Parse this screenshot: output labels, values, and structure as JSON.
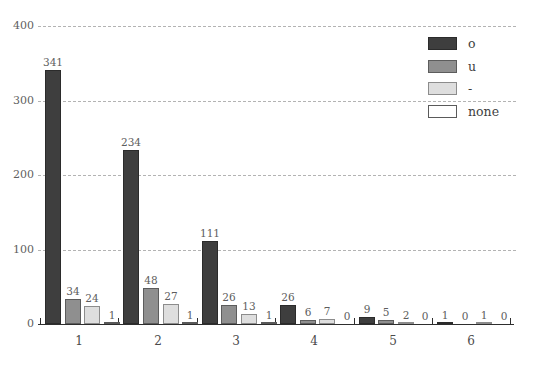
{
  "chart_data": {
    "type": "bar",
    "title": "",
    "xlabel": "",
    "ylabel": "",
    "categories": [
      "1",
      "2",
      "3",
      "4",
      "5",
      "6"
    ],
    "series": [
      {
        "name": "o",
        "fill": "#3e3e3e",
        "border": "#2b2b2b",
        "values": [
          341,
          234,
          111,
          26,
          9,
          1
        ]
      },
      {
        "name": "u",
        "fill": "#8f8f8f",
        "border": "#5c5c5c",
        "values": [
          34,
          48,
          26,
          6,
          5,
          0
        ]
      },
      {
        "name": "-",
        "fill": "#dedede",
        "border": "#8c8c8c",
        "values": [
          24,
          27,
          13,
          7,
          2,
          1
        ]
      },
      {
        "name": "none",
        "fill": "#ffffff",
        "border": "#5a5a5a",
        "values": [
          1,
          1,
          1,
          0,
          0,
          0
        ]
      }
    ],
    "ylim": [
      0,
      400
    ],
    "yticks": [
      0,
      100,
      200,
      300,
      400
    ],
    "grid": "horizontal-dashed",
    "grid_color": "#b3b3b3",
    "axis_color": "#2e2e2e",
    "label_color": "#5d5d5d",
    "legend_position": "top-right",
    "bar_value_labels": true
  }
}
